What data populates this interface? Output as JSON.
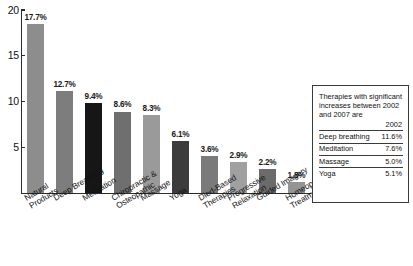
{
  "chart_data": {
    "type": "bar",
    "title": "",
    "xlabel": "",
    "ylabel": "",
    "ylim": [
      0,
      20
    ],
    "yticks": [
      5,
      10,
      15,
      20
    ],
    "ytick_labels": [
      "5",
      "10",
      "15",
      "20"
    ],
    "grid": false,
    "legend_position": "right-box",
    "categories": [
      "Natural Products",
      "Deep Breathing",
      "Meditation",
      "Chiropractic & Osteopathic",
      "Massage",
      "Yoga",
      "Died-Based Therapies",
      "Progressive Relaxation",
      "Guided Imagery",
      "Homeopathic Treatment"
    ],
    "category_lines": [
      [
        "Natural",
        "Products"
      ],
      [
        "Deep Breathing"
      ],
      [
        "Meditation"
      ],
      [
        "Chiropractic &",
        "Osteopathic"
      ],
      [
        "Massage"
      ],
      [
        "Yoga"
      ],
      [
        "Died-Based",
        "Therapies"
      ],
      [
        "Progressive",
        "Relaxation"
      ],
      [
        "Guided Imagery"
      ],
      [
        "Homeopathic",
        "Treatment"
      ]
    ],
    "values": [
      18.5,
      11.1,
      9.8,
      8.9,
      8.5,
      5.7,
      4.0,
      3.4,
      2.6,
      1.2
    ],
    "data_labels": [
      "17.7%",
      "12.7%",
      "9.4%",
      "8.6%",
      "8.3%",
      "6.1%",
      "3.6%",
      "2.9%",
      "2.2%",
      "1.8%"
    ],
    "bar_colors": [
      "#8d8d8d",
      "#7d7d7d",
      "#161616",
      "#6f6f6f",
      "#9a9a9a",
      "#3c3c3c",
      "#7a7a7a",
      "#a0a0a0",
      "#6b6b6b",
      "#949494"
    ],
    "axis_color": "#2b2b2b"
  },
  "legend": {
    "intro": "Therapies with significant increases between 2002 and 2007 are",
    "column_header": "2002",
    "rows": [
      {
        "label": "Deep breathing",
        "value": "11.6%"
      },
      {
        "label": "Meditation",
        "value": "7.6%"
      },
      {
        "label": "Massage",
        "value": "5.0%"
      },
      {
        "label": "Yoga",
        "value": "5.1%"
      }
    ]
  }
}
